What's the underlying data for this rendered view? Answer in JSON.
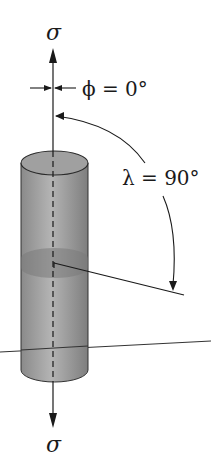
{
  "diagram": {
    "labels": {
      "stress_top": "σ",
      "stress_bottom": "σ",
      "phi": "ϕ = 0°",
      "lambda": "λ = 90°"
    },
    "angles": {
      "phi_deg": 0,
      "lambda_deg": 90
    },
    "colors": {
      "line": "#1a1a1a",
      "cylinder_fill": "#9a9a9a",
      "cylinder_highlight": "#b8b8b8",
      "plane_band": "#7e7e7e"
    }
  }
}
